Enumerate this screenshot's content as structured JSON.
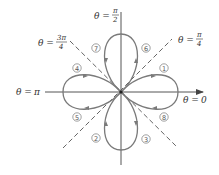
{
  "diagram": {
    "type": "polar-rose",
    "equation": "r = cos 2θ",
    "colors": {
      "curve": "#7a7a7a",
      "axis": "#555555",
      "dashed": "#666666",
      "text": "#333333",
      "circle_label": "#777777"
    },
    "angle_labels": {
      "theta_0": {
        "lhs": "θ =",
        "value": "0"
      },
      "theta_pi_over_2": {
        "lhs": "θ =",
        "num": "π",
        "den": "2"
      },
      "theta_pi_over_4": {
        "lhs": "θ =",
        "num": "π",
        "den": "4"
      },
      "theta_3pi_over_4": {
        "lhs": "θ =",
        "num": "3π",
        "den": "4"
      },
      "theta_pi": {
        "lhs": "θ =",
        "value": "π"
      }
    },
    "loop_labels": [
      {
        "id": "1",
        "glyph": "1",
        "position": "right-upper"
      },
      {
        "id": "2",
        "glyph": "2",
        "position": "bottom-left"
      },
      {
        "id": "3",
        "glyph": "3",
        "position": "bottom-right"
      },
      {
        "id": "4",
        "glyph": "4",
        "position": "left-upper"
      },
      {
        "id": "5",
        "glyph": "5",
        "position": "left-lower"
      },
      {
        "id": "6",
        "glyph": "6",
        "position": "top-right"
      },
      {
        "id": "7",
        "glyph": "7",
        "position": "top-left"
      },
      {
        "id": "8",
        "glyph": "8",
        "position": "right-lower"
      }
    ]
  }
}
